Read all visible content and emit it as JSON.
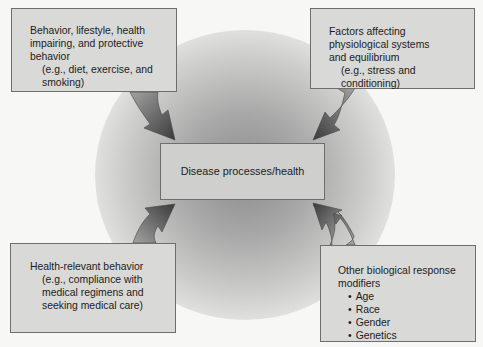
{
  "diagram": {
    "center": {
      "label": "Disease processes/health"
    },
    "top_left": {
      "lines": [
        "Behavior, lifestyle, health",
        "impairing, and protective",
        "behavior"
      ],
      "example_lines": [
        "(e.g., diet, exercise, and",
        "smoking)"
      ]
    },
    "top_right": {
      "lines": [
        "Factors affecting",
        "physiological systems",
        "and equilibrium"
      ],
      "example_lines": [
        "(e.g., stress and",
        "conditioning)"
      ]
    },
    "bottom_left": {
      "lines": [
        "Health-relevant behavior"
      ],
      "example_lines": [
        "(e.g., compliance with",
        "medical regimens and",
        "seeking medical care)"
      ]
    },
    "bottom_right": {
      "lines": [
        "Other biological response",
        "modifiers"
      ],
      "bullets": [
        "Age",
        "Race",
        "Gender",
        "Genetics"
      ]
    },
    "arrows": [
      {
        "from": "top_left",
        "to": "center"
      },
      {
        "from": "top_right",
        "to": "center"
      },
      {
        "from": "bottom_left",
        "to": "center"
      },
      {
        "from": "bottom_right",
        "to": "center"
      }
    ],
    "colors": {
      "box_fill": "#d9d9d7",
      "box_border": "#6e6e6e",
      "arrow_dark": "#3a3a3a",
      "arrow_light": "#9a9a9a",
      "background": "#f7f7f5"
    }
  }
}
